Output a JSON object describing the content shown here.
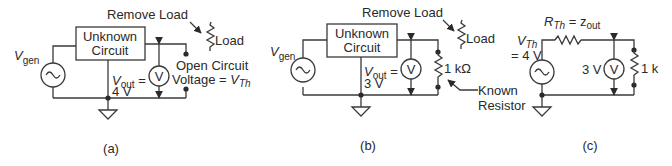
{
  "panels": [
    {
      "id": "a",
      "caption": "(a)",
      "box_line1": "Unknown",
      "box_line2": "Circuit",
      "source_label_main": "V",
      "source_label_sub": "gen",
      "vout_main": "V",
      "vout_sub": "out",
      "vout_eq": " =",
      "vout_value": "4 V",
      "meter_label": "V",
      "remove_load": "Remove Load",
      "load_label": "Load",
      "open_circuit_line1": "Open Circuit",
      "open_circuit_line2": "Voltage = ",
      "vth_main": "V",
      "vth_sub": "Th"
    },
    {
      "id": "b",
      "caption": "(b)",
      "box_line1": "Unknown",
      "box_line2": "Circuit",
      "source_label_main": "V",
      "source_label_sub": "gen",
      "vout_main": "V",
      "vout_sub": "out",
      "vout_eq": " =",
      "vout_value": "3 V",
      "meter_label": "V",
      "remove_load": "Remove Load",
      "load_label": "Load",
      "resistor_label": "1 kΩ",
      "known_line1": "Known",
      "known_line2": "Resistor"
    },
    {
      "id": "c",
      "caption": "(c)",
      "rth_main": "R",
      "rth_sub": "Th",
      "rth_eq": " = z",
      "rth_zsub": "out",
      "vth_main": "V",
      "vth_sub": "Th",
      "vth_value": "= 4 V",
      "meter_value": "3 V",
      "meter_label": "V",
      "resistor_label": "1 k"
    }
  ]
}
